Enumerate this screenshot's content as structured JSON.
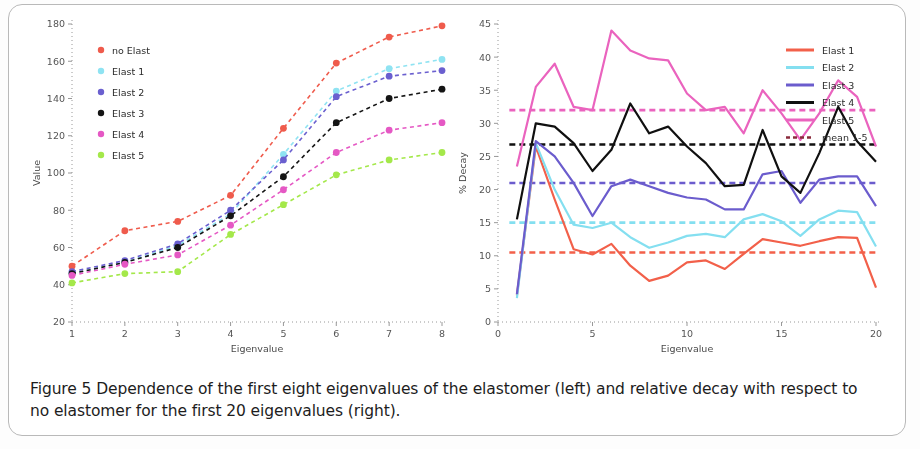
{
  "caption": {
    "text": "Figure 5 Dependence of the first eight eigenvalues of the elastomer (left) and relative decay with respect to no elastomer for the first 20 eigenvalues (right)."
  },
  "colors": {
    "no_elast": "#ef5b4c",
    "elast1_left": "#8fe3f2",
    "elast2_left": "#6a5fcf",
    "elast3_left": "#141414",
    "elast4_left": "#e558c4",
    "elast5_left": "#a4e84a",
    "elast1_right": "#f2604a",
    "elast2_right": "#84dff0",
    "elast3_right": "#6b5ccd",
    "elast4_right": "#101010",
    "elast5_right": "#ea63be",
    "mean_label": "#8a2b3c",
    "axis": "#8d8d8d",
    "text": "#4a4a4a"
  },
  "chart_data": [
    {
      "type": "scatter",
      "id": "left",
      "title": "",
      "xlabel": "Eigenvalue",
      "ylabel": "Value",
      "xlim": [
        1,
        8
      ],
      "ylim": [
        20,
        180
      ],
      "xticks": [
        1,
        2,
        3,
        4,
        5,
        6,
        7,
        8
      ],
      "yticks": [
        20,
        40,
        60,
        80,
        100,
        120,
        140,
        160,
        180
      ],
      "grid": false,
      "legend_position": "upper-left",
      "linestyle": "dashed-with-markers",
      "x": [
        1,
        2,
        3,
        4,
        5,
        6,
        7,
        8
      ],
      "series": [
        {
          "name": "no Elast",
          "color_key": "no_elast",
          "values": [
            50,
            69,
            74,
            88,
            124,
            159,
            173,
            179
          ]
        },
        {
          "name": "Elast 1",
          "color_key": "elast1_left",
          "values": [
            46,
            52,
            61,
            78,
            110,
            144,
            156,
            161
          ]
        },
        {
          "name": "Elast 2",
          "color_key": "elast2_left",
          "values": [
            47,
            53,
            62,
            80,
            107,
            141,
            152,
            155
          ]
        },
        {
          "name": "Elast 3",
          "color_key": "elast3_left",
          "values": [
            46,
            52,
            60,
            77,
            98,
            127,
            140,
            145
          ]
        },
        {
          "name": "Elast 4",
          "color_key": "elast4_left",
          "values": [
            45,
            51,
            56,
            72,
            91,
            111,
            123,
            127
          ]
        },
        {
          "name": "Elast 5",
          "color_key": "elast5_left",
          "values": [
            41,
            46,
            47,
            67,
            83,
            99,
            107,
            111
          ]
        }
      ]
    },
    {
      "type": "line",
      "id": "right",
      "title": "",
      "xlabel": "Eigenvalue",
      "ylabel": "% Decay",
      "xlim": [
        0,
        20
      ],
      "ylim": [
        0,
        45
      ],
      "xticks": [
        0,
        5,
        10,
        15,
        20
      ],
      "yticks": [
        0,
        5,
        10,
        15,
        20,
        25,
        30,
        35,
        40,
        45
      ],
      "grid": false,
      "legend_position": "upper-right",
      "x": [
        1,
        2,
        3,
        4,
        5,
        6,
        7,
        8,
        9,
        10,
        11,
        12,
        13,
        14,
        15,
        16,
        17,
        18,
        19,
        20
      ],
      "series": [
        {
          "name": "Elast 1",
          "color_key": "elast1_right",
          "values": [
            4.0,
            26.5,
            18.5,
            11.0,
            10.2,
            11.8,
            8.5,
            6.2,
            7.0,
            9.0,
            9.3,
            8.0,
            10.3,
            12.5,
            12.0,
            11.5,
            12.2,
            12.8,
            12.7,
            5.2
          ]
        },
        {
          "name": "Elast 2",
          "color_key": "elast2_right",
          "values": [
            3.6,
            27.0,
            20.0,
            14.7,
            14.2,
            15.0,
            12.8,
            11.2,
            12.0,
            13.0,
            13.3,
            12.8,
            15.5,
            16.3,
            15.2,
            13.0,
            15.5,
            16.8,
            16.6,
            11.4
          ]
        },
        {
          "name": "Elast 3",
          "color_key": "elast3_right",
          "values": [
            4.2,
            27.3,
            25.0,
            21.0,
            16.0,
            20.5,
            21.5,
            20.5,
            19.5,
            18.8,
            18.5,
            17.0,
            17.0,
            22.3,
            22.8,
            18.0,
            21.5,
            22.0,
            22.0,
            17.5
          ]
        },
        {
          "name": "Elast 4",
          "color_key": "elast4_right",
          "values": [
            15.5,
            30.0,
            29.5,
            27.0,
            22.8,
            26.0,
            33.0,
            28.5,
            29.5,
            26.5,
            24.0,
            20.5,
            20.7,
            29.0,
            22.0,
            19.5,
            25.5,
            32.5,
            27.3,
            24.2
          ]
        },
        {
          "name": "Elast 5",
          "color_key": "elast5_right",
          "values": [
            23.5,
            35.5,
            39.0,
            32.5,
            32.0,
            44.0,
            41.0,
            39.8,
            39.5,
            34.5,
            32.0,
            32.5,
            28.5,
            35.0,
            31.5,
            27.5,
            31.5,
            36.5,
            34.0,
            26.5
          ]
        }
      ],
      "mean_lines": [
        {
          "name": "mean 1-5",
          "color_key": "elast1_right",
          "value": 10.5
        },
        {
          "name": "mean 1-5",
          "color_key": "elast2_right",
          "value": 15.0
        },
        {
          "name": "mean 1-5",
          "color_key": "elast3_right",
          "value": 21.0
        },
        {
          "name": "mean 1-5",
          "color_key": "elast4_right",
          "value": 26.8
        },
        {
          "name": "mean 1-5",
          "color_key": "elast5_right",
          "value": 32.0
        }
      ],
      "legend_extra": [
        {
          "name": "mean 1-5",
          "color_key": "mean_label",
          "style": "dashed"
        }
      ]
    }
  ]
}
